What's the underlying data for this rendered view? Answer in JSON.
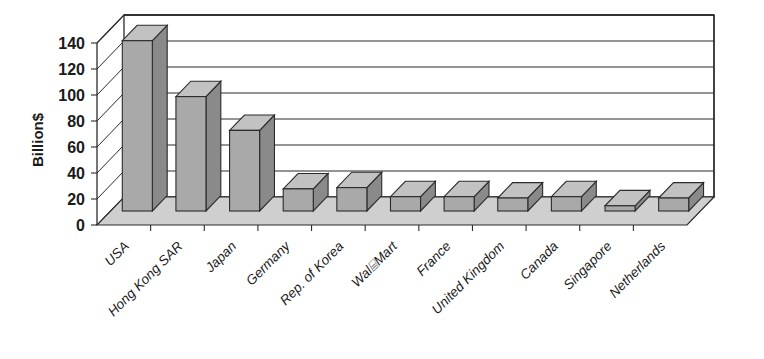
{
  "chart_data": {
    "type": "bar",
    "title": "",
    "subtitle": "",
    "xlabel": "",
    "ylabel": "Billion$",
    "ylim": [
      0,
      140
    ],
    "ytick_step": 20,
    "ytick_labels": [
      "0",
      "20",
      "40",
      "60",
      "80",
      "100",
      "120",
      "140"
    ],
    "grid": true,
    "legend": "none",
    "style": "3d-column-grayscale",
    "units": "Billion$",
    "categories": [
      "USA",
      "Hong Kong SAR",
      "Japan",
      "Germany",
      "Rep. of Korea",
      "Wal⌸Mart",
      "France",
      "United Kingdom",
      "Canada",
      "Singapore",
      "Netherlands"
    ],
    "values": [
      131,
      88,
      62,
      17,
      18,
      11,
      11,
      10,
      11,
      4,
      10
    ],
    "series": [
      {
        "name": "",
        "values": [
          131,
          88,
          62,
          17,
          18,
          11,
          11,
          10,
          11,
          4,
          10
        ]
      }
    ]
  },
  "colors": {
    "bar_front": "#a9a9a9",
    "bar_side": "#8a8a8a",
    "bar_top": "#c2c2c2",
    "floor": "#cfcfcf",
    "wall": "#ffffff",
    "line": "#2b2b2b",
    "text": "#1a1a1a",
    "background": "#ffffff"
  }
}
